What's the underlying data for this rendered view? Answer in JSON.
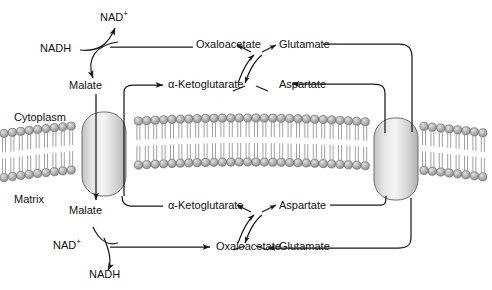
{
  "diagram": {
    "compartments": {
      "upper_label": "Cytoplasm",
      "lower_label": "Matrix"
    },
    "cytoplasm": {
      "cofactor_in": "NADH",
      "cofactor_out": "NAD",
      "cofactor_out_charge": "+",
      "metabolite_left": "Malate",
      "metabolite_oxaloacetate": "Oxaloacetate",
      "metabolite_ketoglutarate": "α-Ketoglutarate",
      "metabolite_glutamate": "Glutamate",
      "metabolite_aspartate": "Aspartate"
    },
    "matrix": {
      "cofactor_in": "NAD",
      "cofactor_in_charge": "+",
      "cofactor_out": "NADH",
      "metabolite_left": "Malate",
      "metabolite_ketoglutarate": "α-Ketoglutarate",
      "metabolite_aspartate": "Aspartate",
      "metabolite_oxaloacetate": "Oxaloacetate",
      "metabolite_glutamate": "Glutamate"
    },
    "transporters": {
      "left_name": "malate-alpha-ketoglutarate-transporter",
      "right_name": "glutamate-aspartate-transporter"
    },
    "colors": {
      "line": "#1a1a1a",
      "lipid_head_fill": "#a9a9a9",
      "lipid_head_stroke": "#5a5a5a",
      "lipid_tail": "#9a9a9a",
      "protein_fill_light": "#f2f2f2",
      "protein_fill_dark": "#b4b4b4",
      "protein_stroke": "#6e6e6e",
      "text": "#111111",
      "background": "#ffffff"
    }
  }
}
